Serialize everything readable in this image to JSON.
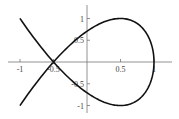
{
  "chart_data": {
    "type": "line",
    "title": "",
    "xlabel": "",
    "ylabel": "",
    "xlim": [
      -1.2,
      1.25
    ],
    "ylim": [
      -1.2,
      1.3
    ],
    "grid": false,
    "legend": null,
    "x_ticks": [
      {
        "value": -1,
        "label": "-1"
      },
      {
        "value": -0.5,
        "label": "-0.5"
      },
      {
        "value": 0.5,
        "label": "0.5"
      },
      {
        "value": 1,
        "label": "1"
      }
    ],
    "y_ticks": [
      {
        "value": 1,
        "label": "1"
      },
      {
        "value": 0.5,
        "label": "0.5"
      },
      {
        "value": -0.5,
        "label": "-0.5"
      },
      {
        "value": -1,
        "label": "-1"
      }
    ],
    "series": [
      {
        "name": "parametric curve (nodal loop)",
        "parametric": {
          "x": "1 - 1.5 t^2",
          "y": "2.6 t (1 - t^2)",
          "t_range": [
            -1.155,
            1.155
          ]
        },
        "key_points": [
          {
            "x": -1,
            "y": 1
          },
          {
            "x": -0.5,
            "y": 0,
            "note": "self-intersection (node)"
          },
          {
            "x": 0,
            "y": 0.73
          },
          {
            "x": 0.5,
            "y": 1
          },
          {
            "x": 1,
            "y": 0
          },
          {
            "x": 0.5,
            "y": -1
          },
          {
            "x": 0,
            "y": -0.73
          },
          {
            "x": -1,
            "y": -1
          }
        ],
        "color": "#000000"
      }
    ]
  },
  "plot": {
    "axis_color": "#666666",
    "curve_color": "#111111"
  }
}
